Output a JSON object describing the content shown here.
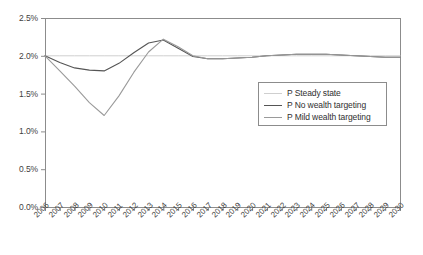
{
  "chart_data": {
    "type": "line",
    "title": "",
    "xlabel": "",
    "ylabel": "",
    "grid": false,
    "legend_position": "inside-right",
    "ylim": [
      0.0,
      2.5
    ],
    "ytick_labels": [
      "0.0%",
      "0.5%",
      "1.0%",
      "1.5%",
      "2.0%",
      "2.5%"
    ],
    "ytick_values": [
      0.0,
      0.5,
      1.0,
      1.5,
      2.0,
      2.5
    ],
    "categories": [
      "2006",
      "2007",
      "2008",
      "2009",
      "2010",
      "2011",
      "2012",
      "2013",
      "2014",
      "2015",
      "2016",
      "2017",
      "2018",
      "2019",
      "2020",
      "2021",
      "2022",
      "2023",
      "2024",
      "2025",
      "2026",
      "2027",
      "2028",
      "2029",
      "2030"
    ],
    "series": [
      {
        "name": "P Steady state",
        "color": "#cfcfcf",
        "width": 1.0,
        "values": [
          2.0,
          2.0,
          2.0,
          2.0,
          2.0,
          2.0,
          2.0,
          2.0,
          2.0,
          2.0,
          2.0,
          2.0,
          2.0,
          2.0,
          2.0,
          2.0,
          2.0,
          2.0,
          2.0,
          2.0,
          2.0,
          2.0,
          2.0,
          2.0,
          2.0
        ]
      },
      {
        "name": "P No wealth targeting",
        "color": "#555555",
        "width": 1.1,
        "values": [
          2.0,
          1.91,
          1.84,
          1.81,
          1.8,
          1.9,
          2.04,
          2.17,
          2.21,
          2.1,
          1.99,
          1.96,
          1.96,
          1.97,
          1.98,
          2.0,
          2.01,
          2.02,
          2.02,
          2.02,
          2.01,
          2.0,
          1.99,
          1.98,
          1.98
        ]
      },
      {
        "name": "P Mild wealth targeting",
        "color": "#9a9a9a",
        "width": 1.1,
        "values": [
          2.0,
          1.8,
          1.6,
          1.38,
          1.21,
          1.47,
          1.78,
          2.05,
          2.22,
          2.12,
          2.0,
          1.96,
          1.96,
          1.97,
          1.98,
          2.0,
          2.01,
          2.02,
          2.02,
          2.02,
          2.01,
          2.0,
          1.99,
          1.98,
          1.98
        ]
      }
    ]
  },
  "legend": {
    "items": [
      {
        "label": "P Steady state",
        "color": "#cfcfcf",
        "width": 1.0
      },
      {
        "label": "P No wealth targeting",
        "color": "#555555",
        "width": 1.3
      },
      {
        "label": "P Mild wealth targeting",
        "color": "#9a9a9a",
        "width": 1.8
      }
    ]
  },
  "axes": {
    "frame_color": "#8c8c8c",
    "tick_color": "#8c8c8c"
  }
}
